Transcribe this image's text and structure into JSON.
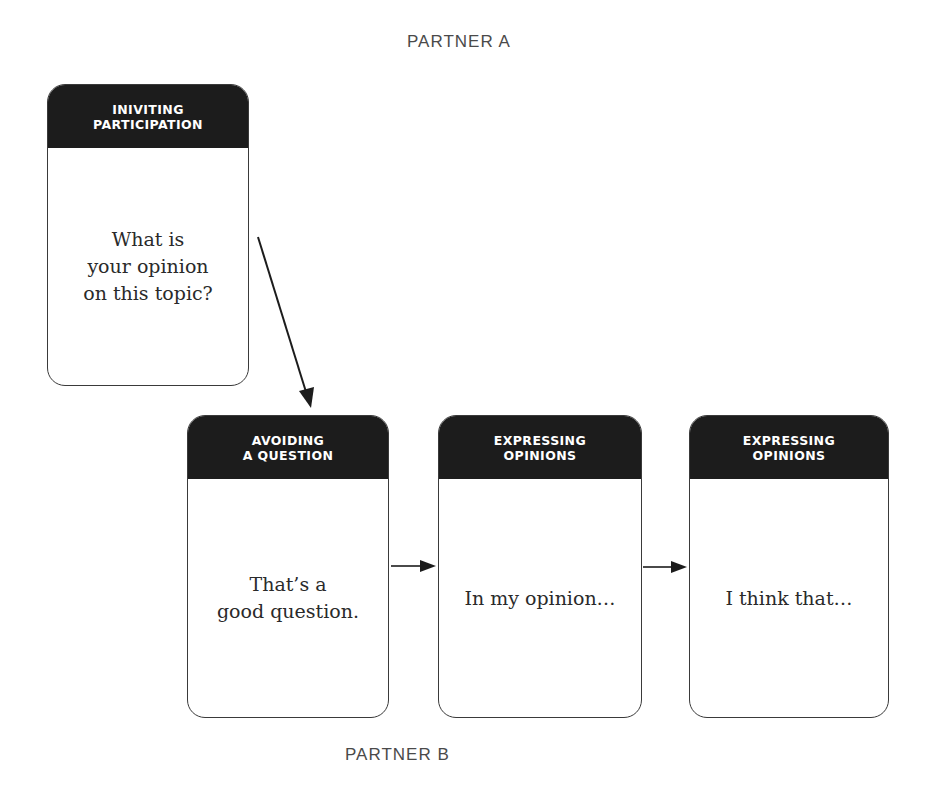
{
  "labels": {
    "top": "PARTNER A",
    "bottom": "PARTNER B"
  },
  "cards": [
    {
      "id": "inviting-participation",
      "header_lines": [
        "INIVITING",
        "PARTICIPATION"
      ],
      "body_lines": [
        "What is",
        "your opinion",
        "on this topic?"
      ]
    },
    {
      "id": "avoiding-a-question",
      "header_lines": [
        "AVOIDING",
        "A QUESTION"
      ],
      "body_lines": [
        "That’s a",
        "good question."
      ]
    },
    {
      "id": "expressing-opinions-1",
      "header_lines": [
        "EXPRESSING",
        "OPINIONS"
      ],
      "body_lines": [
        "In my opinion…"
      ]
    },
    {
      "id": "expressing-opinions-2",
      "header_lines": [
        "EXPRESSING",
        "OPINIONS"
      ],
      "body_lines": [
        "I think that…"
      ]
    }
  ],
  "colors": {
    "header_bg": "#1c1c1c",
    "header_text": "#ffffff",
    "border": "#3a3a3a",
    "body_text": "#2a2a2a",
    "label_text": "#4a4a4a"
  }
}
